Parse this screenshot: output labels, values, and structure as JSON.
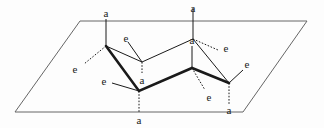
{
  "figure": {
    "name": "cyclohexane-chair-axial-equatorial-diagram",
    "caption": "",
    "background_color": "#fdfdfd",
    "line_color": "#1a1a1a",
    "plane_color": "#555555",
    "width": 324,
    "height": 128
  },
  "plane": {
    "name": "reference-plane-parallelogram",
    "points": "80,21 307,21 243,112 15,112",
    "stroke": "#666666",
    "stroke_width": 1
  },
  "ring": {
    "bold_path": "106,46 139,91 192,68 229,83",
    "thin_path": "229,83 193,39 142,62 106,46",
    "bold_width": 2.6,
    "thin_width": 1,
    "vertices": [
      {
        "id": "C1",
        "x": 106,
        "y": 46,
        "label": "up-left-front"
      },
      {
        "id": "C2",
        "x": 139,
        "y": 91,
        "label": "down-front"
      },
      {
        "id": "C3",
        "x": 192,
        "y": 68,
        "label": "up-mid-front"
      },
      {
        "id": "C4",
        "x": 229,
        "y": 83,
        "label": "down-right-front"
      },
      {
        "id": "C5",
        "x": 193,
        "y": 39,
        "label": "up-right-back"
      },
      {
        "id": "C6",
        "x": 142,
        "y": 62,
        "label": "down-mid-back"
      }
    ]
  },
  "bonds": [
    {
      "id": "a1",
      "type": "axial",
      "style": "solid",
      "from": "106,46",
      "to": "106,19",
      "label": "a",
      "label_x": 106,
      "label_y": 13
    },
    {
      "id": "e1",
      "type": "equatorial",
      "style": "dotted",
      "from": "106,46",
      "to": "84,64",
      "label": "e",
      "label_x": 75,
      "label_y": 69
    },
    {
      "id": "a2",
      "type": "axial",
      "style": "dotted",
      "from": "139,91",
      "to": "139,113",
      "label": "a",
      "label_x": 139,
      "label_y": 120
    },
    {
      "id": "e2",
      "type": "equatorial",
      "style": "solid",
      "from": "139,91",
      "to": "112,83",
      "label": "e",
      "label_x": 104,
      "label_y": 81
    },
    {
      "id": "a3",
      "type": "axial",
      "style": "solid",
      "from": "192,68",
      "to": "192,46",
      "label": "a",
      "label_x": 192,
      "label_y": 40
    },
    {
      "id": "e3",
      "type": "equatorial",
      "style": "dotted",
      "from": "192,68",
      "to": "205,90",
      "label": "e",
      "label_x": 209,
      "label_y": 97
    },
    {
      "id": "a4",
      "type": "axial",
      "style": "dotted",
      "from": "229,83",
      "to": "229,104",
      "label": "a",
      "label_x": 229,
      "label_y": 110
    },
    {
      "id": "e4",
      "type": "equatorial",
      "style": "solid",
      "from": "229,83",
      "to": "243,70",
      "label": "e",
      "label_x": 247,
      "label_y": 64
    },
    {
      "id": "a5",
      "type": "axial",
      "style": "solid",
      "from": "193,39",
      "to": "193,8",
      "label": "a",
      "label_x": 193,
      "label_y": 8
    },
    {
      "id": "e5",
      "type": "equatorial",
      "style": "dotted",
      "from": "193,39",
      "to": "218,50",
      "label": "e",
      "label_x": 226,
      "label_y": 48
    },
    {
      "id": "a6",
      "type": "axial",
      "style": "dotted",
      "from": "142,62",
      "to": "142,73",
      "label": "a",
      "label_x": 142,
      "label_y": 80
    },
    {
      "id": "e6",
      "type": "equatorial",
      "style": "solid",
      "from": "142,62",
      "to": "128,42",
      "label": "e",
      "label_x": 126,
      "label_y": 38
    }
  ],
  "labels": {
    "axial": "a",
    "equatorial": "e"
  },
  "chart_data": {
    "type": "diagram",
    "axial_label_count": 6,
    "equatorial_label_count": 6,
    "axial_positions": [
      {
        "label": "a",
        "x": 106,
        "y": 13
      },
      {
        "label": "a",
        "x": 193,
        "y": 8
      },
      {
        "label": "a",
        "x": 192,
        "y": 40
      },
      {
        "label": "a",
        "x": 142,
        "y": 80
      },
      {
        "label": "a",
        "x": 139,
        "y": 120
      },
      {
        "label": "a",
        "x": 229,
        "y": 110
      }
    ],
    "equatorial_positions": [
      {
        "label": "e",
        "x": 126,
        "y": 38
      },
      {
        "label": "e",
        "x": 226,
        "y": 48
      },
      {
        "label": "e",
        "x": 75,
        "y": 69
      },
      {
        "label": "e",
        "x": 247,
        "y": 64
      },
      {
        "label": "e",
        "x": 104,
        "y": 81
      },
      {
        "label": "e",
        "x": 209,
        "y": 97
      }
    ]
  }
}
